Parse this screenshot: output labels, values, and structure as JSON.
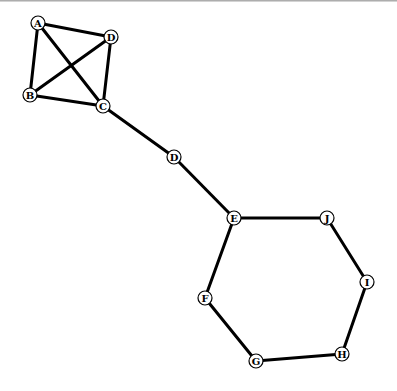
{
  "graph": {
    "node_radius": 7,
    "nodes": [
      {
        "id": "A",
        "label": "A",
        "x": 38,
        "y": 23
      },
      {
        "id": "D1",
        "label": "D",
        "x": 111,
        "y": 37
      },
      {
        "id": "B",
        "label": "B",
        "x": 30,
        "y": 95
      },
      {
        "id": "C",
        "label": "C",
        "x": 103,
        "y": 106
      },
      {
        "id": "D2",
        "label": "D",
        "x": 174,
        "y": 157
      },
      {
        "id": "E",
        "label": "E",
        "x": 234,
        "y": 218
      },
      {
        "id": "J",
        "label": "J",
        "x": 327,
        "y": 218
      },
      {
        "id": "I",
        "label": "I",
        "x": 367,
        "y": 282
      },
      {
        "id": "H",
        "label": "H",
        "x": 342,
        "y": 354
      },
      {
        "id": "G",
        "label": "G",
        "x": 256,
        "y": 361
      },
      {
        "id": "F",
        "label": "F",
        "x": 205,
        "y": 298
      }
    ],
    "edges": [
      [
        "A",
        "D1"
      ],
      [
        "A",
        "B"
      ],
      [
        "A",
        "C"
      ],
      [
        "D1",
        "B"
      ],
      [
        "D1",
        "C"
      ],
      [
        "B",
        "C"
      ],
      [
        "C",
        "D2"
      ],
      [
        "D2",
        "E"
      ],
      [
        "E",
        "J"
      ],
      [
        "J",
        "I"
      ],
      [
        "I",
        "H"
      ],
      [
        "H",
        "G"
      ],
      [
        "G",
        "F"
      ],
      [
        "F",
        "E"
      ]
    ]
  }
}
